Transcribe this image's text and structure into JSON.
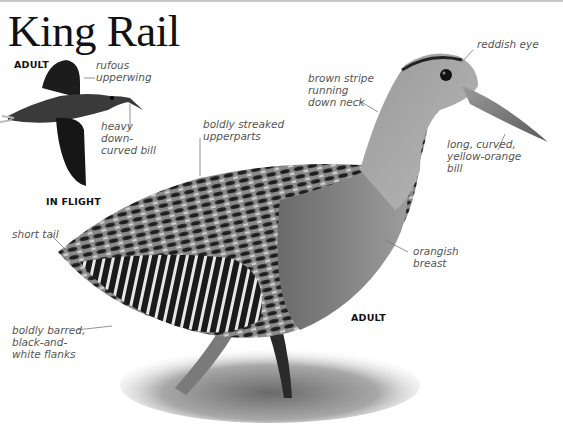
{
  "title": "King Rail",
  "flight_view": {
    "age_label": "ADULT",
    "caption": "IN FLIGHT",
    "annotations": [
      {
        "id": "rufous-upperwing",
        "text": "rufous\nupperwing"
      },
      {
        "id": "heavy-bill",
        "text": "heavy\ndown-\ncurved bill"
      }
    ]
  },
  "main_view": {
    "age_label": "ADULT",
    "annotations": [
      {
        "id": "reddish-eye",
        "text": "reddish eye"
      },
      {
        "id": "brown-stripe",
        "text": "brown stripe\nrunning\ndown neck"
      },
      {
        "id": "streaked-upperparts",
        "text": "boldly streaked\nupperparts"
      },
      {
        "id": "long-bill",
        "text": "long, curved,\nyellow-orange\nbill"
      },
      {
        "id": "short-tail",
        "text": "short tail"
      },
      {
        "id": "orangish-breast",
        "text": "orangish\nbreast"
      },
      {
        "id": "barred-flanks",
        "text": "boldly barred,\nblack-and-\nwhite flanks"
      }
    ]
  },
  "colors": {
    "title": "#111111",
    "label_text": "#555555",
    "leader_line": "#777777",
    "rule": "#c8c8c8"
  }
}
